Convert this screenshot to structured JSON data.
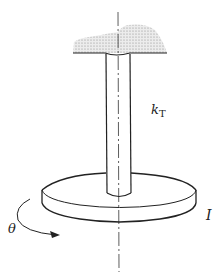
{
  "figure": {
    "labels": {
      "stiffness": "k",
      "stiffness_sub": "T",
      "inertia": "I",
      "angle": "θ"
    },
    "colors": {
      "ink": "#222222",
      "ceiling_fill": "#d8d8d8"
    }
  }
}
